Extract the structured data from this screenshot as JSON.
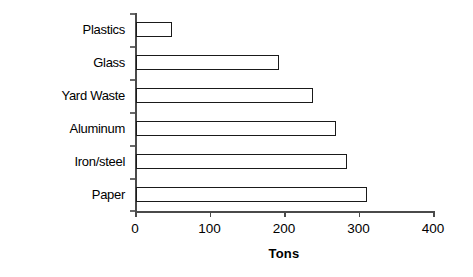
{
  "chart_data": {
    "type": "bar",
    "orientation": "horizontal",
    "title": "",
    "xlabel": "Tons",
    "ylabel": "Type of Waste",
    "categories": [
      "Plastics",
      "Glass",
      "Yard Waste",
      "Aluminum",
      "Iron/steel",
      "Paper"
    ],
    "values": [
      48,
      192,
      238,
      268,
      283,
      310
    ],
    "xlim": [
      0,
      400
    ],
    "xticks": [
      0,
      100,
      200,
      300,
      400
    ],
    "xtick_labels": [
      "0",
      "100",
      "200",
      "300",
      "400"
    ],
    "grid": false,
    "legend": false,
    "bar_fill_color": "#ffffff",
    "bar_edge_color": "#1a1a1a",
    "axis_color": "#4a4a4a",
    "background_color": "#ffffff"
  },
  "axes": {
    "y_title": "Type of Waste",
    "x_title": "Tons"
  }
}
